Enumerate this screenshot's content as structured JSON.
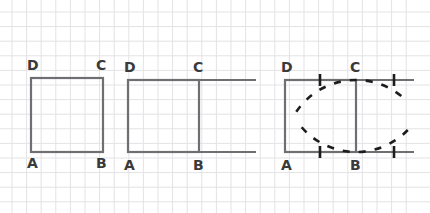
{
  "figure": {
    "background_color": "#ffffff",
    "grid": {
      "visible": true,
      "spacing_px": 14.6,
      "color": "#e3e3e6",
      "line_width": 1,
      "origin_x": 12,
      "origin_y": 12,
      "extent_x": 420,
      "extent_y": 204
    },
    "stroke": {
      "shape_color": "#6e6e73",
      "shape_width": 2.2,
      "mark_color": "#1c1c1c",
      "mark_width": 2.6,
      "dash_pattern": "7 9"
    },
    "label_color": "#3a3a3a",
    "label_font_size": 14
  },
  "panels": [
    {
      "id": "panel-1",
      "name": "square-only",
      "square": {
        "left": 31,
        "right": 103,
        "top": 78,
        "bottom": 152
      },
      "vertices": [
        {
          "id": "D",
          "label": "D",
          "corner": "top-left",
          "label_x": 27,
          "label_y": 58
        },
        {
          "id": "C",
          "label": "C",
          "corner": "top-right",
          "label_x": 96,
          "label_y": 58
        },
        {
          "id": "A",
          "label": "A",
          "corner": "bottom-left",
          "label_x": 27,
          "label_y": 156
        },
        {
          "id": "B",
          "label": "B",
          "corner": "bottom-right",
          "label_x": 96,
          "label_y": 156
        }
      ],
      "extensions": [],
      "ticks": [],
      "arcs": []
    },
    {
      "id": "panel-2",
      "name": "square-with-extended-sides",
      "square": {
        "left": 128,
        "right": 199,
        "top": 80,
        "bottom": 152
      },
      "vertices": [
        {
          "id": "D",
          "label": "D",
          "corner": "top-left",
          "label_x": 124,
          "label_y": 60
        },
        {
          "id": "C",
          "label": "C",
          "corner": "top-right",
          "label_x": 193,
          "label_y": 60
        },
        {
          "id": "A",
          "label": "A",
          "corner": "bottom-left",
          "label_x": 124,
          "label_y": 158
        },
        {
          "id": "B",
          "label": "B",
          "corner": "bottom-right",
          "label_x": 193,
          "label_y": 158
        }
      ],
      "extensions": [
        {
          "from_x": 199,
          "to_x": 256,
          "y": 80,
          "name": "top-ray-DC-extended"
        },
        {
          "from_x": 199,
          "to_x": 256,
          "y": 152,
          "name": "bottom-ray-AB-extended"
        }
      ],
      "ticks": [],
      "arcs": []
    },
    {
      "id": "panel-3",
      "name": "square-with-compass-arcs",
      "square": {
        "left": 285,
        "right": 356,
        "top": 80,
        "bottom": 152
      },
      "vertices": [
        {
          "id": "D",
          "label": "D",
          "corner": "top-left",
          "label_x": 281,
          "label_y": 60
        },
        {
          "id": "C",
          "label": "C",
          "corner": "top-right",
          "label_x": 350,
          "label_y": 60
        },
        {
          "id": "A",
          "label": "A",
          "corner": "bottom-left",
          "label_x": 281,
          "label_y": 158
        },
        {
          "id": "B",
          "label": "B",
          "corner": "bottom-right",
          "label_x": 350,
          "label_y": 158
        }
      ],
      "extensions": [
        {
          "from_x": 356,
          "to_x": 414,
          "y": 80,
          "name": "top-ray-DC-extended"
        },
        {
          "from_x": 356,
          "to_x": 414,
          "y": 152,
          "name": "bottom-ray-AB-extended"
        }
      ],
      "ticks": [
        {
          "x": 320,
          "y": 80,
          "name": "tick-midpoint-DC"
        },
        {
          "x": 320,
          "y": 152,
          "name": "tick-midpoint-AB"
        },
        {
          "x": 394,
          "y": 80,
          "name": "tick-on-top-ray"
        },
        {
          "x": 394,
          "y": 152,
          "name": "tick-on-bottom-ray"
        }
      ],
      "arcs": [
        {
          "name": "arc-centered-at-B",
          "center_x": 356,
          "center_y": 152,
          "radius": 72,
          "start_deg": 214,
          "end_deg": 316
        },
        {
          "name": "arc-centered-at-C",
          "center_x": 356,
          "center_y": 80,
          "radius": 72,
          "start_deg": 44,
          "end_deg": 146
        }
      ]
    }
  ]
}
